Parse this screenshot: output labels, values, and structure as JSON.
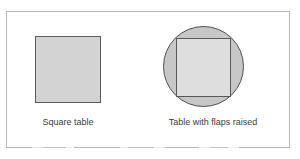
{
  "figure": {
    "width": 300,
    "height": 159,
    "background_color": "#ffffff",
    "frame": {
      "name": "outer-border",
      "color": "#b9b9b9"
    },
    "items": [
      {
        "id": "square-table",
        "caption": "Square table",
        "shapes": [
          {
            "kind": "square",
            "fill": "#d3d3d3",
            "stroke": "#5c5c5c"
          }
        ]
      },
      {
        "id": "flaps-table",
        "caption": "Table with flaps raised",
        "shapes": [
          {
            "kind": "circle",
            "fill": "#c7c7c7",
            "stroke": "#4f4f4f"
          },
          {
            "kind": "square",
            "fill": "#dedede",
            "stroke": "#585858"
          }
        ]
      }
    ]
  }
}
